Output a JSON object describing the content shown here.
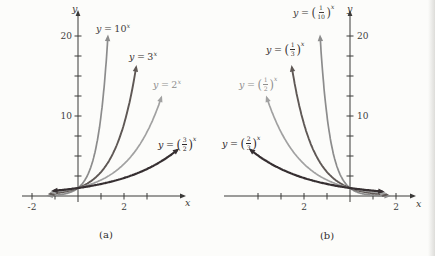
{
  "page": {
    "background": "#fcfcfa",
    "axis_color": "#3b3a38"
  },
  "chart_data": [
    {
      "type": "line",
      "title": "(a)",
      "xlabel": "x",
      "ylabel": "y",
      "xlim": [
        -2.4,
        4.5
      ],
      "ylim": [
        0,
        22.5
      ],
      "grid": false,
      "legend": "inline-curve-labels",
      "x_ticks": [
        -2,
        -1,
        1,
        2,
        3
      ],
      "y_ticks": [
        2.5,
        5,
        7.5,
        10,
        12.5,
        15,
        17.5,
        20
      ],
      "x_tick_labels": [
        {
          "text": "-2",
          "unit": -2
        },
        {
          "text": "2",
          "unit": 2
        }
      ],
      "y_tick_labels": [
        {
          "text": "10",
          "unit": 10
        },
        {
          "text": "20",
          "unit": 20
        }
      ],
      "series": [
        {
          "name": "y-equals-10-to-x",
          "expression": "y = 10^x",
          "base": 10,
          "x_range": [
            -1.25,
            1.2967
          ],
          "color": "#8c8c8c",
          "stroke_width": 1.7,
          "label": {
            "var": "y",
            "eq": "=",
            "base": "10",
            "num": null,
            "den": null,
            "exp": "x",
            "x": 96,
            "y": 24,
            "color": "#413c3a"
          }
        },
        {
          "name": "y-equals-3-to-x",
          "expression": "y = 3^x",
          "base": 3,
          "x_range": [
            -1.18,
            2.524
          ],
          "color": "#5f5855",
          "stroke_width": 1.9,
          "label": {
            "var": "y",
            "eq": "=",
            "base": "3",
            "num": null,
            "den": null,
            "exp": "x",
            "x": 129,
            "y": 52,
            "color": "#352f2d"
          }
        },
        {
          "name": "y-equals-2-to-x",
          "expression": "y = 2^x",
          "base": 2,
          "x_range": [
            -1.11,
            3.608
          ],
          "color": "#a1a1a1",
          "stroke_width": 1.7,
          "label": {
            "var": "y",
            "eq": "=",
            "base": "2",
            "num": null,
            "den": null,
            "exp": "x",
            "x": 153,
            "y": 80,
            "color": "#8e8e8e"
          }
        },
        {
          "name": "y-equals-3-halves-to-x",
          "expression": "y = (3/2)^x",
          "base": 1.5,
          "x_range": [
            -1.04,
            4.3
          ],
          "color": "#362f31, ",
          "stroke_width": 2.2,
          "label": {
            "var": "y",
            "eq": "=",
            "base": null,
            "num": "3",
            "den": "2",
            "exp": "x",
            "x": 158,
            "y": 137,
            "color": "#2c2729"
          }
        }
      ],
      "geometry": {
        "left": 0,
        "width": 218,
        "height": 256,
        "origin": [
          78,
          196
        ],
        "unit": [
          23,
          8
        ],
        "x_axis": [
          22,
          181
        ],
        "y_axis": [
          15,
          202
        ],
        "x_label_pos": [
          185,
          198
        ],
        "y_label_pos": [
          72,
          4
        ],
        "y_tick_side": "left",
        "caption_pos": [
          106,
          230
        ]
      }
    },
    {
      "type": "line",
      "title": "(b)",
      "xlabel": "x",
      "ylabel": "y",
      "xlim": [
        -4.5,
        2.4
      ],
      "ylim": [
        0,
        22.5
      ],
      "grid": false,
      "legend": "inline-curve-labels",
      "x_ticks": [
        -4,
        -3,
        -2,
        -1,
        1,
        2
      ],
      "y_ticks": [
        2.5,
        5,
        7.5,
        10,
        12.5,
        15,
        17.5,
        20
      ],
      "x_tick_labels": [
        {
          "text": "2",
          "unit": -2
        },
        {
          "text": "2",
          "unit": 2
        }
      ],
      "y_tick_labels": [
        {
          "text": "10",
          "unit": 10
        },
        {
          "text": "20",
          "unit": 20
        }
      ],
      "series": [
        {
          "name": "y-equals-one-tenth-to-x",
          "expression": "y = (1/10)^x",
          "base": 0.1,
          "x_range": [
            -1.2967,
            1.65
          ],
          "color": "#8c8c8c",
          "stroke_width": 1.7,
          "label": {
            "var": "y",
            "eq": "=",
            "base": null,
            "num": "1",
            "den": "10",
            "exp": "x",
            "x": 75,
            "y": 5,
            "color": "#413c3a"
          }
        },
        {
          "name": "y-equals-one-third-to-x",
          "expression": "y = (1/3)^x",
          "base": 0.33333,
          "x_range": [
            -2.524,
            1.56
          ],
          "color": "#5f5855",
          "stroke_width": 1.9,
          "label": {
            "var": "y",
            "eq": "=",
            "base": null,
            "num": "1",
            "den": "3",
            "exp": "x",
            "x": 48,
            "y": 42,
            "color": "#352f2d"
          }
        },
        {
          "name": "y-equals-one-half-to-x",
          "expression": "y = (1/2)^x",
          "base": 0.5,
          "x_range": [
            -3.608,
            1.47
          ],
          "color": "#a1a1a1",
          "stroke_width": 1.7,
          "label": {
            "var": "y",
            "eq": "=",
            "base": null,
            "num": "1",
            "den": "2",
            "exp": "x",
            "x": 21,
            "y": 77,
            "color": "#8e8e8e"
          }
        },
        {
          "name": "y-equals-two-thirds-to-x",
          "expression": "y = (2/3)^x",
          "base": 0.66667,
          "x_range": [
            -4.3,
            1.38
          ],
          "color": "#362f31",
          "stroke_width": 2.2,
          "label": {
            "var": "y",
            "eq": "=",
            "base": null,
            "num": "2",
            "den": "3",
            "exp": "x",
            "x": 4,
            "y": 136,
            "color": "#2c2729"
          }
        }
      ],
      "geometry": {
        "left": 218,
        "width": 217,
        "height": 256,
        "origin": [
          132,
          196
        ],
        "unit": [
          23,
          8
        ],
        "x_axis": [
          6,
          193
        ],
        "y_axis": [
          15,
          202
        ],
        "x_label_pos": [
          198,
          199
        ],
        "y_label_pos": [
          129,
          4
        ],
        "y_tick_side": "right",
        "caption_pos": [
          109,
          231
        ]
      }
    }
  ]
}
